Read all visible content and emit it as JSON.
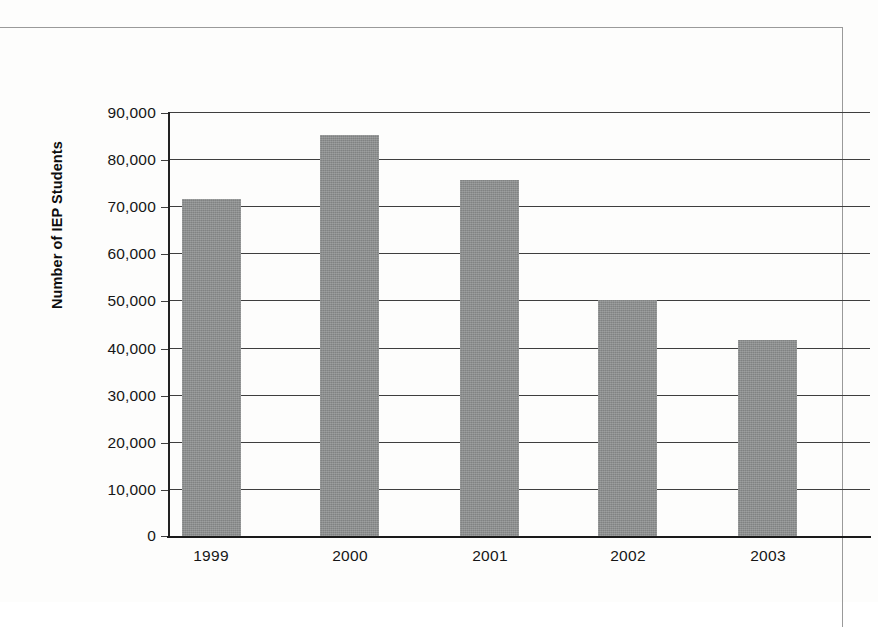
{
  "chart_data": {
    "type": "bar",
    "title": "",
    "xlabel": "",
    "ylabel": "Number of IEP Students",
    "categories": [
      "1999",
      "2000",
      "2001",
      "2002",
      "2003"
    ],
    "values": [
      71500,
      85200,
      75500,
      50000,
      41700
    ],
    "series": [
      {
        "name": "Number of IEP Students",
        "values": [
          71500,
          85200,
          75500,
          50000,
          41700
        ]
      }
    ],
    "ylim": [
      0,
      90000
    ],
    "ytick_values": [
      0,
      10000,
      20000,
      30000,
      40000,
      50000,
      60000,
      70000,
      80000,
      90000
    ],
    "ytick_labels": [
      "0",
      "10,000",
      "20,000",
      "30,000",
      "40,000",
      "50,000",
      "60,000",
      "70,000",
      "80,000",
      "90,000"
    ],
    "grid": true,
    "grid_axis": "y",
    "legend": false,
    "legend_position": "none",
    "bar_color": "#8a8c8c",
    "axis_color": "#1a1a1a",
    "gridline_color": "#3e3e3e",
    "background_color": "#fdfdfc"
  }
}
